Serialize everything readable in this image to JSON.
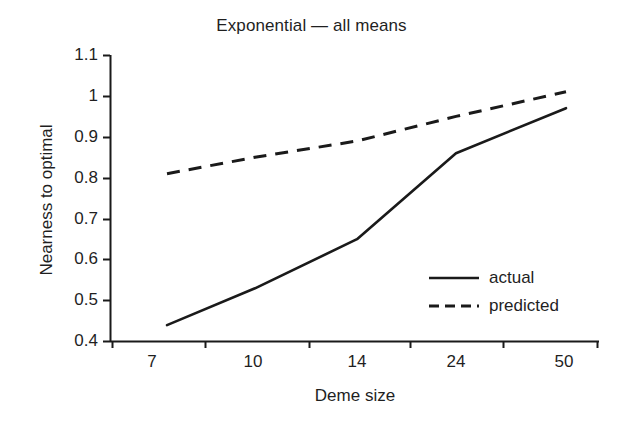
{
  "chart_data": {
    "type": "line",
    "title": "Exponential — all means",
    "xlabel": "Deme size",
    "ylabel": "Nearness to optimal",
    "categories": [
      "7",
      "10",
      "14",
      "24",
      "50"
    ],
    "series": [
      {
        "name": "actual",
        "style": "solid",
        "values": [
          0.44,
          0.53,
          0.65,
          0.86,
          0.97
        ]
      },
      {
        "name": "predicted",
        "style": "dashed",
        "values": [
          0.81,
          0.85,
          0.89,
          0.95,
          1.01
        ]
      }
    ],
    "ylim": [
      0.4,
      1.1
    ],
    "yticks": [
      "1.1",
      "1",
      "0.9",
      "0.8",
      "0.7",
      "0.6",
      "0.5",
      "0.4"
    ],
    "ytick_values": [
      1.1,
      1.0,
      0.9,
      0.8,
      0.7,
      0.6,
      0.5,
      0.4
    ],
    "xticks": [
      "7",
      "10",
      "14",
      "24",
      "50"
    ],
    "grid": false,
    "legend_position": "inside-right",
    "line_color": "#1a1a1a"
  },
  "legend": {
    "entries": [
      {
        "label": "actual",
        "sample": "solid-line-sample"
      },
      {
        "label": "predicted",
        "sample": "dashed-line-sample"
      }
    ]
  }
}
